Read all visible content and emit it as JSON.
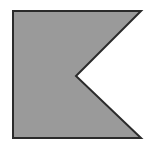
{
  "canvas": {
    "width": 149,
    "height": 144,
    "background_color": "#ffffff",
    "title": "Swallowtail flag shape"
  },
  "shape": {
    "name": "swallowtail-flag-polygon",
    "description": "Gray filled rectangle with a V-shaped notch cut into its right edge, forming a swallowtail pennant",
    "fill_color": "#9a9a9a",
    "stroke_color": "#2b2b2b",
    "stroke_width": 2,
    "points": "13,11 141,11 76,76 141,138 13,138",
    "vertices": [
      {
        "label": "top-left",
        "x": 13,
        "y": 11
      },
      {
        "label": "top-right",
        "x": 141,
        "y": 11
      },
      {
        "label": "notch-apex",
        "x": 76,
        "y": 76
      },
      {
        "label": "bottom-right",
        "x": 141,
        "y": 138
      },
      {
        "label": "bottom-left",
        "x": 13,
        "y": 138
      }
    ]
  }
}
